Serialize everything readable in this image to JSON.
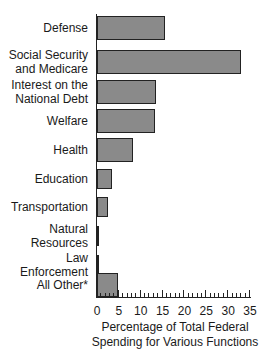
{
  "chart_data": {
    "type": "bar",
    "orientation": "horizontal",
    "title": "",
    "categories": [
      "Defense",
      "Social Security and Medicare",
      "Interest on the National Debt",
      "Welfare",
      "Health",
      "Education",
      "Transportation",
      "Natural Resources",
      "Law Enforcement",
      "All Other*"
    ],
    "category_lines": [
      [
        "Defense"
      ],
      [
        "Social Security",
        "and Medicare"
      ],
      [
        "Interest on the",
        "National Debt"
      ],
      [
        "Welfare"
      ],
      [
        "Health"
      ],
      [
        "Education"
      ],
      [
        "Transportation"
      ],
      [
        "Natural",
        "Resources"
      ],
      [
        "Law",
        "Enforcement"
      ],
      [
        "All Other*"
      ]
    ],
    "values": [
      15.5,
      33,
      13.5,
      13.3,
      8.2,
      3.4,
      2.5,
      0.5,
      0.5,
      4.8
    ],
    "xlabel": "Percentage of Total Federal Spending for Various Functions",
    "xlabel_lines": [
      "Percentage of Total Federal",
      "Spending for Various Functions"
    ],
    "ylabel": "",
    "xlim": [
      0,
      35
    ],
    "xticks": [
      0,
      5,
      10,
      15,
      20,
      25,
      30,
      35
    ],
    "minor_tick_step": 1,
    "grid": false,
    "bar_color": "#8a8a8a",
    "edge_color": "#222222"
  }
}
